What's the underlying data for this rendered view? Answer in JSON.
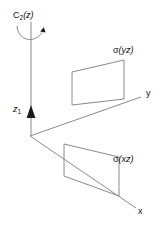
{
  "figure": {
    "background_color": "#ffffff",
    "line_color": "#8a8a8a",
    "text_color": "#111111",
    "labels": {
      "rotation_axis": {
        "symbol": "C",
        "subscript": "2",
        "argument": "(z)",
        "full": "C2(z)"
      },
      "z_axis": {
        "symbol": "z",
        "subscript": "1",
        "full": "z1"
      },
      "y_axis": "y",
      "x_axis": "x",
      "plane_yz": {
        "sigma": "σ",
        "argument": "(yz)",
        "full": "σ(yz)"
      },
      "plane_xz": {
        "sigma": "σ",
        "argument": "(xz)",
        "full": "σ(xz)"
      }
    },
    "icons": {
      "rotation_arc": "curved-rotation-arrow-icon",
      "z_arrowhead": "up-arrowhead-icon"
    },
    "geometry": {
      "origin": [
        30,
        136
      ],
      "z_axis_top": [
        31,
        22
      ],
      "z_arrowhead_tip": [
        31,
        106
      ],
      "y_axis_end": [
        141,
        97
      ],
      "x_axis_end": [
        136,
        208
      ],
      "plane_yz_corners": [
        [
          72,
          72
        ],
        [
          124,
          60
        ],
        [
          124,
          99
        ],
        [
          72,
          105
        ]
      ],
      "plane_xz_corners": [
        [
          64,
          144
        ],
        [
          119,
          157
        ],
        [
          119,
          196
        ],
        [
          64,
          176
        ]
      ]
    }
  }
}
